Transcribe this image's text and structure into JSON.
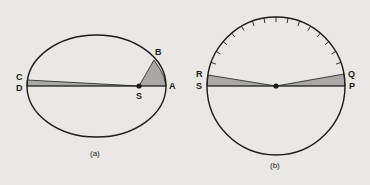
{
  "colors": {
    "background": "#e9e8e4",
    "stroke": "#1c1c1c",
    "shade": "#a9a8a6"
  },
  "panel_a": {
    "caption": "(a)",
    "shape": "ellipse",
    "points": {
      "A": "A",
      "B": "B",
      "C": "C",
      "D": "D",
      "S": "S"
    }
  },
  "panel_b": {
    "caption": "(b)",
    "shape": "circle",
    "points": {
      "P": "P",
      "Q": "Q",
      "R": "R",
      "S": "S"
    }
  }
}
